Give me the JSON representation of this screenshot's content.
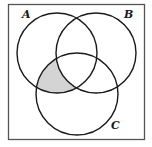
{
  "diagram": {
    "type": "venn",
    "frame": {
      "x": 8,
      "y": 4,
      "width": 137,
      "height": 136,
      "stroke": "#444444"
    },
    "sets": [
      {
        "label": "A",
        "cx": 57,
        "cy": 53,
        "r": 40,
        "label_x": 22,
        "label_y": 18
      },
      {
        "label": "B",
        "cx": 96,
        "cy": 53,
        "r": 40,
        "label_x": 124,
        "label_y": 18
      },
      {
        "label": "C",
        "cx": 77,
        "cy": 94,
        "r": 41,
        "label_x": 111,
        "label_y": 129
      }
    ],
    "shaded_region": {
      "description": "A ∩ C − B",
      "fill": "#d4d4d4"
    },
    "stroke_color": "#1a1a1a"
  }
}
